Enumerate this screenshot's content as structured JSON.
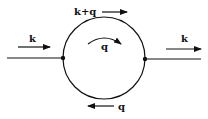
{
  "diagram": {
    "type": "feynman-one-loop-self-energy",
    "colors": {
      "line": "#111111",
      "background": "#ffffff"
    },
    "external_lines": {
      "incoming": {
        "label": "k",
        "direction": "right"
      },
      "outgoing": {
        "label": "k",
        "direction": "right"
      }
    },
    "loop": {
      "upper_propagator": {
        "label": "k+q",
        "direction": "right"
      },
      "lower_propagator": {
        "label": "q",
        "direction": "left"
      },
      "loop_momentum": {
        "label": "q",
        "direction": "clockwise"
      }
    },
    "vertices": [
      {
        "name": "left-vertex"
      },
      {
        "name": "right-vertex"
      }
    ]
  }
}
